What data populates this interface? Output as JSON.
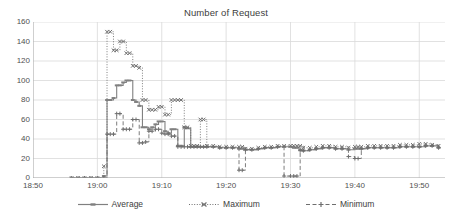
{
  "chart_data": {
    "type": "line",
    "title": "Number of Request",
    "xlabel": "",
    "ylabel": "",
    "ylim": [
      0,
      160
    ],
    "ytick_step": 20,
    "yticks": [
      0,
      20,
      40,
      60,
      80,
      100,
      120,
      140,
      160
    ],
    "xticks": [
      "18:50",
      "19:00",
      "19:10",
      "19:20",
      "19:30",
      "19:40",
      "19:50"
    ],
    "xlim": [
      "18:50",
      "19:54"
    ],
    "grid": "horizontal-and-vertical",
    "legend_position": "bottom",
    "x": [
      "18:56",
      "18:57",
      "18:58",
      "18:59",
      "19:00",
      "19:01",
      "19:01",
      "19:02",
      "19:02",
      "19:03",
      "19:03",
      "19:04",
      "19:04",
      "19:05",
      "19:05",
      "19:06",
      "19:06",
      "19:07",
      "19:07",
      "19:08",
      "19:08",
      "19:09",
      "19:09",
      "19:10",
      "19:10",
      "19:11",
      "19:11",
      "19:12",
      "19:12",
      "19:13",
      "19:13",
      "19:14",
      "19:14",
      "19:15",
      "19:15",
      "19:16",
      "19:16",
      "19:17",
      "19:18",
      "19:19",
      "19:20",
      "19:21",
      "19:22",
      "19:22",
      "19:23",
      "19:24",
      "19:25",
      "19:26",
      "19:27",
      "19:28",
      "19:29",
      "19:30",
      "19:30",
      "19:31",
      "19:31",
      "19:32",
      "19:33",
      "19:34",
      "19:35",
      "19:36",
      "19:37",
      "19:38",
      "19:39",
      "19:40",
      "19:40",
      "19:41",
      "19:42",
      "19:43",
      "19:44",
      "19:45",
      "19:46",
      "19:47",
      "19:48",
      "19:49",
      "19:50",
      "19:51",
      "19:52",
      "19:53"
    ],
    "series": [
      {
        "name": "Average",
        "style": "solid",
        "marker": "dash",
        "color": "#808080",
        "values": [
          0,
          0,
          0,
          0,
          0,
          2,
          80,
          80,
          82,
          95,
          95,
          98,
          100,
          100,
          80,
          78,
          74,
          52,
          52,
          50,
          52,
          55,
          58,
          58,
          48,
          46,
          50,
          50,
          33,
          33,
          52,
          51,
          32,
          32,
          32,
          32,
          32,
          32,
          32,
          31,
          31,
          31,
          30,
          30,
          29,
          29,
          30,
          31,
          31,
          32,
          32,
          32,
          31,
          31,
          29,
          28,
          29,
          30,
          31,
          31,
          30,
          30,
          29,
          30,
          30,
          30,
          31,
          31,
          31,
          31,
          31,
          32,
          32,
          32,
          32,
          33,
          33,
          31
        ]
      },
      {
        "name": "Maximum",
        "style": "dotted",
        "marker": "x",
        "color": "#707070",
        "values": [
          0,
          0,
          0,
          0,
          0,
          12,
          150,
          150,
          131,
          131,
          140,
          140,
          128,
          128,
          115,
          115,
          113,
          80,
          80,
          70,
          70,
          70,
          73,
          73,
          65,
          65,
          80,
          80,
          80,
          80,
          52,
          52,
          33,
          33,
          33,
          60,
          60,
          33,
          33,
          32,
          32,
          32,
          32,
          32,
          30,
          30,
          31,
          32,
          32,
          33,
          33,
          33,
          33,
          33,
          33,
          31,
          31,
          32,
          33,
          33,
          32,
          32,
          31,
          32,
          32,
          32,
          33,
          33,
          33,
          33,
          33,
          34,
          34,
          34,
          35,
          35,
          34,
          33
        ]
      },
      {
        "name": "Minimum",
        "style": "dashed",
        "marker": "plus",
        "color": "#6e6e6e",
        "values": [
          0,
          0,
          0,
          0,
          0,
          0,
          45,
          45,
          45,
          66,
          66,
          50,
          50,
          50,
          60,
          60,
          36,
          36,
          37,
          48,
          48,
          50,
          50,
          46,
          45,
          45,
          43,
          43,
          32,
          32,
          32,
          32,
          32,
          32,
          32,
          32,
          32,
          32,
          32,
          31,
          31,
          31,
          8,
          8,
          29,
          29,
          30,
          31,
          31,
          32,
          2,
          2,
          2,
          2,
          28,
          28,
          29,
          30,
          31,
          31,
          30,
          30,
          22,
          20,
          20,
          30,
          31,
          31,
          31,
          31,
          31,
          32,
          32,
          32,
          32,
          33,
          33,
          31
        ]
      }
    ]
  },
  "axis": {
    "y_max": 160,
    "y_min": 0
  },
  "legend": {
    "items": [
      {
        "label": "Average"
      },
      {
        "label": "Maximum"
      },
      {
        "label": "Minimum"
      }
    ]
  },
  "colors": {
    "grid": "#d9d9d9",
    "axis": "#a6a6a6",
    "text": "#404040",
    "average": "#808080",
    "maximum": "#707070",
    "minimum": "#6e6e6e"
  }
}
